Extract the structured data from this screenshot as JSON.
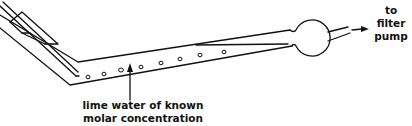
{
  "diagram": {
    "colors": {
      "stroke": "#111111",
      "background": "#ffffff"
    },
    "labels": {
      "lime_water_line1": "lime water of known",
      "lime_water_line2": "molar concentration",
      "pump_line1": "to",
      "pump_line2": "filter",
      "pump_line3": "pump"
    },
    "components": [
      {
        "name": "inlet-tube",
        "type": "glass tube"
      },
      {
        "name": "reaction-tube",
        "type": "angled glass tube",
        "bubbles": 8
      },
      {
        "name": "bulb-trap",
        "type": "spherical bulb"
      },
      {
        "name": "outlet-tube",
        "type": "glass tube"
      },
      {
        "name": "flow-arrow",
        "direction": "right"
      },
      {
        "name": "pointer-arrow",
        "direction": "up",
        "target": "lime water"
      }
    ]
  }
}
